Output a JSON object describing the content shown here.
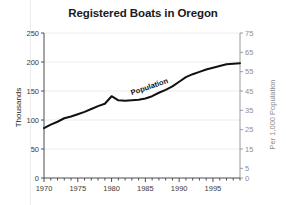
{
  "chart_data": {
    "type": "line",
    "title": "Registered Boats in Oregon",
    "xlabel": "",
    "ylabel": "Thousands",
    "ylabel_right": "Per 1,000 Population",
    "xlim": [
      1970,
      1999
    ],
    "ylim": [
      0,
      250
    ],
    "ylim_right": [
      0,
      75
    ],
    "grid": true,
    "legend_position": "inline-on-curve",
    "yticks": [
      0,
      50,
      100,
      150,
      200,
      250
    ],
    "yticks_right": [
      0,
      5,
      15,
      25,
      35,
      45,
      55,
      65,
      75
    ],
    "xticks": [
      1970,
      1975,
      1980,
      1985,
      1990,
      1995
    ],
    "xtick_labels": [
      "1970",
      "1975",
      "1980",
      "1985",
      "1990",
      "1995"
    ],
    "x": [
      1970,
      1971,
      1972,
      1973,
      1974,
      1975,
      1976,
      1977,
      1978,
      1979,
      1980,
      1981,
      1982,
      1983,
      1984,
      1985,
      1986,
      1987,
      1988,
      1989,
      1990,
      1991,
      1992,
      1993,
      1994,
      1995,
      1996,
      1997,
      1998,
      1999
    ],
    "series": [
      {
        "name": "Boats per 1,000 Population",
        "color": "#808080",
        "axis": "right",
        "label_text": "Boats per 1,000 Population",
        "values": [
          143,
          148,
          153,
          157,
          160,
          162,
          166,
          170,
          172,
          175,
          188,
          178,
          176,
          175,
          175,
          177,
          180,
          184,
          189,
          196,
          204,
          205,
          205,
          206,
          206,
          207,
          207,
          206,
          203,
          200
        ]
      },
      {
        "name": "Population",
        "color": "#111111",
        "axis": "left",
        "label_text": "Population",
        "values": [
          86,
          92,
          97,
          103,
          106,
          110,
          114,
          119,
          124,
          128,
          141,
          134,
          133,
          134,
          135,
          137,
          141,
          147,
          152,
          158,
          166,
          174,
          179,
          183,
          187,
          190,
          193,
          196,
          197,
          198
        ]
      }
    ]
  },
  "axes": {
    "left_title": "Thousands",
    "right_title": "Per 1,000 Population"
  }
}
